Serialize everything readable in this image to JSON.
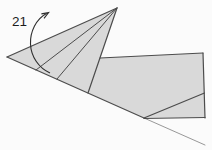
{
  "figure": {
    "label": {
      "text": "21"
    },
    "colors": {
      "background": "#fbfbfb",
      "fill": "#d9d9d9",
      "stroke": "#4c4c4c",
      "thin_line": "#7d7d7d",
      "arrow": "#2e2e2e",
      "label": "#1c1c1c"
    },
    "polygons": [
      {
        "name": "flap-fan-face",
        "points": [
          [
            7,
            57
          ],
          [
            117,
            8
          ],
          [
            88,
            93
          ]
        ]
      },
      {
        "name": "panel-face",
        "points": [
          [
            100,
            58
          ],
          [
            203,
            53
          ],
          [
            205,
            118
          ],
          [
            144,
            118
          ],
          [
            88,
            93
          ]
        ]
      }
    ],
    "lines": [
      {
        "name": "edge-tip-to-apex",
        "from": [
          7,
          57
        ],
        "to": [
          117,
          8
        ],
        "width": 1.2
      },
      {
        "name": "crease-apex-left",
        "from": [
          117,
          8
        ],
        "to": [
          36,
          70
        ],
        "width": 1.0
      },
      {
        "name": "crease-apex-right",
        "from": [
          117,
          8
        ],
        "to": [
          57,
          79
        ],
        "width": 1.0
      },
      {
        "name": "edge-apex-to-baseline",
        "from": [
          117,
          8
        ],
        "to": [
          88,
          93
        ],
        "width": 1.2
      },
      {
        "name": "baseline-main",
        "from": [
          7,
          57
        ],
        "to": [
          144,
          118
        ],
        "width": 1.2
      },
      {
        "name": "baseline-extension",
        "from": [
          144,
          118
        ],
        "to": [
          205,
          145
        ],
        "width": 0.8,
        "color": "#7d7d7d"
      },
      {
        "name": "panel-top-edge",
        "from": [
          100,
          58
        ],
        "to": [
          203,
          53
        ],
        "width": 1.2
      },
      {
        "name": "panel-right-edge",
        "from": [
          203,
          53
        ],
        "to": [
          205,
          118
        ],
        "width": 1.2
      },
      {
        "name": "panel-bottom-edge",
        "from": [
          205,
          117.5
        ],
        "to": [
          144,
          118.5
        ],
        "width": 1.2
      },
      {
        "name": "crease-corner-diagonal",
        "from": [
          144,
          118
        ],
        "to": [
          204.5,
          93
        ],
        "width": 1.2
      }
    ],
    "arrow": {
      "curve": "M 50 73 C 39 68 31 57 30.5 44 C 30 32 36 19 46.5 13.5",
      "head": "M 44 18.4 L 48.6 12.6 L 41.4 13.9",
      "width": 1.1
    }
  }
}
